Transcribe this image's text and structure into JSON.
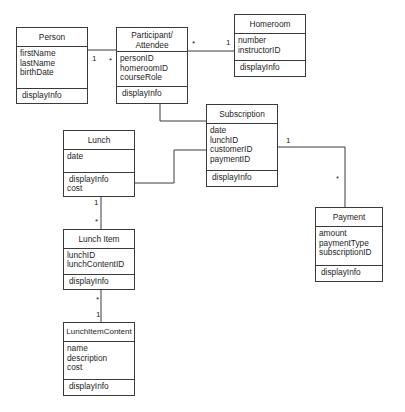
{
  "diagram": {
    "type": "UML class diagram",
    "classes": {
      "person": {
        "name": "Person",
        "attributes": [
          "firstName",
          "lastName",
          "birthDate"
        ],
        "operations": [
          "displayInfo"
        ]
      },
      "participant": {
        "name": "Participant/\nAttendee",
        "attributes": [
          "personID",
          "homeroomID",
          "courseRole"
        ],
        "operations": [
          "displayInfo"
        ]
      },
      "homeroom": {
        "name": "Homeroom",
        "attributes": [
          "number",
          "instructorID"
        ],
        "operations": [
          "displayInfo"
        ]
      },
      "subscription": {
        "name": "Subscription",
        "attributes": [
          "date",
          "lunchID",
          "customerID",
          "paymentID"
        ],
        "operations": [
          "displayInfo"
        ]
      },
      "lunch": {
        "name": "Lunch",
        "attributes": [
          "date"
        ],
        "operations": [
          "displayInfo",
          "cost"
        ]
      },
      "lunch_item": {
        "name": "Lunch Item",
        "attributes": [
          "lunchID",
          "lunchContentID"
        ],
        "operations": [
          "displayInfo"
        ]
      },
      "lunch_item_content": {
        "name": "LunchItemContent",
        "attributes": [
          "name",
          "description",
          "cost"
        ],
        "operations": [
          "displayInfo"
        ]
      },
      "payment": {
        "name": "Payment",
        "attributes": [
          "amount",
          "paymentType",
          "subscriptionID"
        ],
        "operations": [
          "displayInfo"
        ]
      }
    },
    "associations": [
      {
        "from": "Person",
        "to": "Participant/Attendee",
        "from_mult": "1",
        "to_mult": "*"
      },
      {
        "from": "Participant/Attendee",
        "to": "Homeroom",
        "from_mult": "*",
        "to_mult": "1"
      },
      {
        "from": "Participant/Attendee",
        "to": "Subscription",
        "from_mult": "",
        "to_mult": ""
      },
      {
        "from": "Lunch",
        "to": "Subscription",
        "from_mult": "",
        "to_mult": ""
      },
      {
        "from": "Subscription",
        "to": "Payment",
        "from_mult": "1",
        "to_mult": "*"
      },
      {
        "from": "Lunch",
        "to": "Lunch Item",
        "from_mult": "1",
        "to_mult": "*"
      },
      {
        "from": "Lunch Item",
        "to": "LunchItemContent",
        "from_mult": "*",
        "to_mult": "1"
      }
    ],
    "multiplicities": {
      "person_participant_1": "1",
      "person_participant_star": "*",
      "participant_homeroom_star": "*",
      "participant_homeroom_1": "1",
      "subscription_payment_1": "1",
      "subscription_payment_star": "*",
      "lunch_lunchitem_1": "1",
      "lunch_lunchitem_star": "*",
      "lunchitem_content_star": "*",
      "lunchitem_content_1": "1"
    }
  }
}
